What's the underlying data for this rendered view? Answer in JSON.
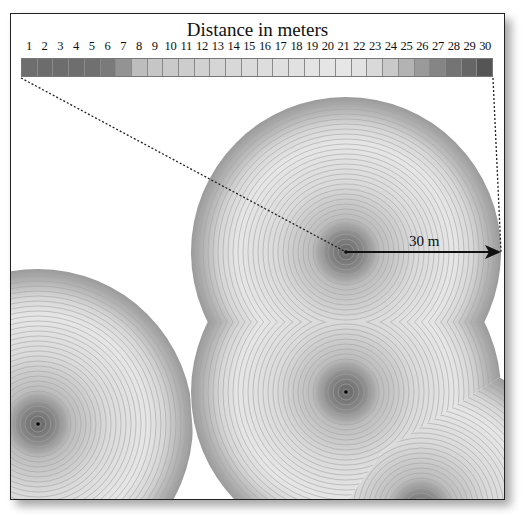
{
  "title": "Distance in meters",
  "legend": {
    "ticks": [
      "1",
      "2",
      "3",
      "4",
      "5",
      "6",
      "7",
      "8",
      "9",
      "10",
      "11",
      "12",
      "13",
      "14",
      "15",
      "16",
      "17",
      "18",
      "19",
      "20",
      "21",
      "22",
      "23",
      "24",
      "25",
      "26",
      "27",
      "28",
      "29",
      "30"
    ],
    "colors": [
      "#6e6e6e",
      "#6c6c6c",
      "#6d6d6d",
      "#6e6e6e",
      "#707070",
      "#7a7a7a",
      "#939393",
      "#bdbdbd",
      "#c6c6c6",
      "#cacaca",
      "#cdcdcd",
      "#d1d1d1",
      "#d5d5d5",
      "#d8d8d8",
      "#dbdbdb",
      "#dddddd",
      "#dfdfdf",
      "#e1e1e1",
      "#e3e3e3",
      "#e5e5e5",
      "#e6e6e6",
      "#e2e2e2",
      "#d9d9d9",
      "#c9c9c9",
      "#b3b3b3",
      "#9a9a9a",
      "#858585",
      "#747474",
      "#666666",
      "#555555"
    ]
  },
  "annotation": {
    "radius_label": "30 m"
  },
  "chart_data": {
    "type": "heatmap",
    "title": "Distance in meters",
    "legend_range": [
      1,
      30
    ],
    "legend_unit": "meters",
    "sources": [
      {
        "name": "point-1",
        "x": 335,
        "y": 238,
        "radius_m": 30
      },
      {
        "name": "point-2",
        "x": 335,
        "y": 378,
        "radius_m": 30
      },
      {
        "name": "point-3",
        "x": 27,
        "y": 410,
        "radius_m": 30
      },
      {
        "name": "point-4",
        "x": 410,
        "y": 497,
        "radius_m": 30
      }
    ],
    "annotations": [
      "30 m radius arrow from point-1 to buffer edge"
    ]
  }
}
